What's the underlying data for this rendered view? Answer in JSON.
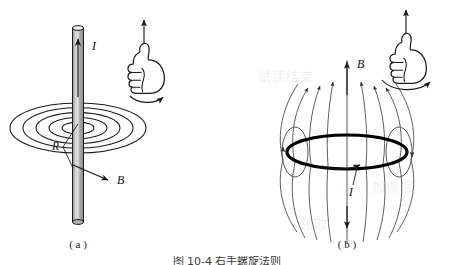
{
  "figure": {
    "title_caption": "图 10-4  右手螺旋法则",
    "background_artifacts": [
      {
        "text": "试读结束",
        "x": 258,
        "y": 66
      },
      {
        "text": "加微信",
        "x": 372,
        "y": 176
      },
      {
        "text": "资料",
        "x": 40,
        "y": 126
      },
      {
        "text": "领取",
        "x": 300,
        "y": 214
      }
    ],
    "panels": [
      {
        "id": "a",
        "caption": "( a )",
        "description": "straight-current-wire-with-circular-field-lines",
        "labels": {
          "current": "I",
          "radius": "R",
          "field": "B"
        },
        "hand_rule": {
          "icon": "thumbs-up-hand-icon",
          "thumb_arrow": "straight-up-arrow",
          "curl_arrow": "curved-arrow-clockwise"
        },
        "field_line_rings": 5,
        "rod": {
          "orientation": "vertical",
          "fill_color": "#a8a8a8",
          "highlight_color": "#d9d9d9",
          "outline_color": "#1a1a1a"
        }
      },
      {
        "id": "b",
        "caption": "( b )",
        "description": "circular-current-loop-with-dipole-field",
        "labels": {
          "field": "B",
          "current": "I"
        },
        "hand_rule": {
          "icon": "thumbs-up-hand-icon",
          "thumb_arrow": "straight-up-arrow",
          "curl_arrow": "curved-arrow-clockwise"
        },
        "loop": {
          "shape": "ellipse",
          "stroke_color": "#000000",
          "stroke_width": 3.2
        },
        "field_line_count": 12,
        "side_loop_count": 2
      }
    ],
    "colors": {
      "ink": "#1a1a1a",
      "field_line": "#555555",
      "background": "#ffffff"
    }
  }
}
